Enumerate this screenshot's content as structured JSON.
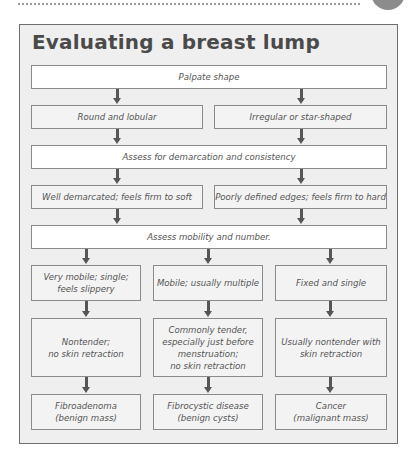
{
  "header": {
    "decor_line": "dotted-rule",
    "decor_circle": "gray-circle"
  },
  "figure": {
    "title": "Evaluating a breast lump",
    "steps": {
      "step1": "Palpate shape",
      "shape_options": [
        "Round and lobular",
        "Irregular or star-shaped"
      ],
      "step2": "Assess for demarcation and consistency",
      "demarcation_options": [
        "Well demarcated; feels firm to soft",
        "Poorly defined edges; feels firm to hard"
      ],
      "step3": "Assess mobility and number.",
      "mobility_options": [
        "Very mobile; single;\nfeels slippery",
        "Mobile; usually multiple",
        "Fixed and single"
      ],
      "tenderness_options": [
        "Nontender;\nno skin retraction",
        "Commonly tender,\nespecially just before\nmenstruation;\nno skin retraction",
        "Usually nontender with\nskin retraction"
      ],
      "outcomes": [
        "Fibroadenoma\n(benign mass)",
        "Fibrocystic disease\n(benign cysts)",
        "Cancer\n(malignant mass)"
      ]
    }
  },
  "colors": {
    "frame_bg": "#efefef",
    "frame_border": "#6e6e6e",
    "box_bg": "#f3f3f3",
    "box_white": "#ffffff",
    "arrow": "#555555",
    "title": "#4a4a4a"
  }
}
